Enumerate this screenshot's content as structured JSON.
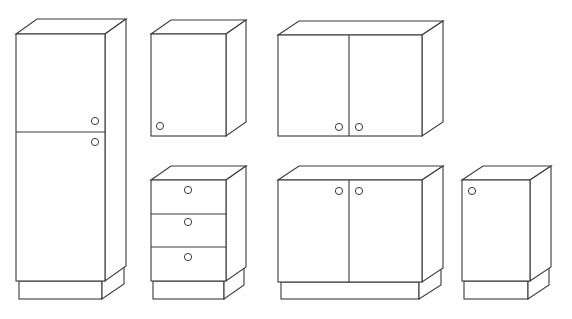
{
  "figure": {
    "title": "Kitchen cabinet modules (line drawing)",
    "stroke_color": "#3a3a3a",
    "background": "#ffffff",
    "cabinets": [
      {
        "id": "tall-cabinet",
        "label": "Tall cabinet with two doors",
        "front": [
          16,
          34,
          105,
          281
        ],
        "depth": [
          21,
          -15
        ],
        "dividers_y": [
          132
        ],
        "dividers_x": [],
        "plinth": [
          19,
          281,
          102,
          299
        ],
        "knobs": [
          [
            95,
            121
          ],
          [
            95,
            142
          ]
        ]
      },
      {
        "id": "wall-cabinet-single",
        "label": "Single-door wall cabinet",
        "front": [
          151,
          34,
          226,
          136
        ],
        "depth": [
          20,
          -14
        ],
        "dividers_y": [],
        "dividers_x": [],
        "plinth": null,
        "knobs": [
          [
            160,
            126
          ]
        ]
      },
      {
        "id": "wall-cabinet-double",
        "label": "Double-door wall cabinet",
        "front": [
          278,
          35,
          422,
          136
        ],
        "depth": [
          21,
          -14
        ],
        "dividers_y": [],
        "dividers_x": [
          349
        ],
        "plinth": null,
        "knobs": [
          [
            339,
            127
          ],
          [
            359,
            127
          ]
        ]
      },
      {
        "id": "drawer-unit",
        "label": "Three-drawer base unit",
        "front": [
          151,
          180,
          226,
          281
        ],
        "depth": [
          20,
          -14
        ],
        "dividers_y": [
          214,
          247
        ],
        "dividers_x": [],
        "plinth": [
          153,
          281,
          224,
          299
        ],
        "knobs": [
          [
            188,
            190
          ],
          [
            188,
            222
          ],
          [
            188,
            257
          ]
        ]
      },
      {
        "id": "base-cabinet-double",
        "label": "Double-door base cabinet",
        "front": [
          278,
          180,
          422,
          282
        ],
        "depth": [
          21,
          -14
        ],
        "dividers_y": [],
        "dividers_x": [
          349
        ],
        "plinth": [
          281,
          282,
          419,
          299
        ],
        "knobs": [
          [
            339,
            191
          ],
          [
            359,
            191
          ]
        ]
      },
      {
        "id": "base-cabinet-single",
        "label": "Single-door base cabinet",
        "front": [
          462,
          180,
          530,
          281
        ],
        "depth": [
          21,
          -14
        ],
        "dividers_y": [],
        "dividers_x": [],
        "plinth": [
          464,
          281,
          528,
          299
        ],
        "knobs": [
          [
            472,
            191
          ]
        ]
      }
    ]
  }
}
